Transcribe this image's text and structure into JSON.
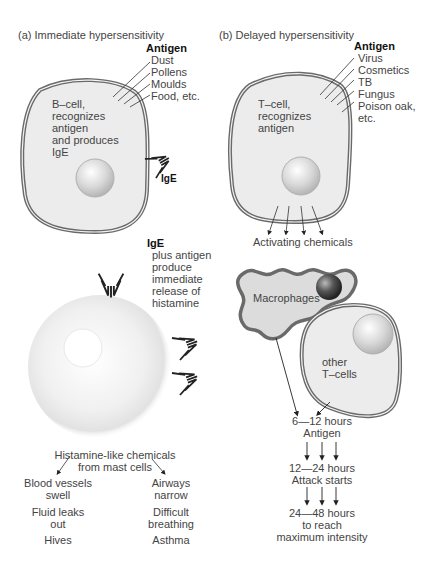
{
  "panel_a": {
    "title": "(a) Immediate hypersensitivity",
    "antigen_heading": "Antigen",
    "antigens": [
      "Dust",
      "Pollens",
      "Moulds",
      "Food, etc."
    ],
    "b_cell_label": [
      "B–cell,",
      "recognizes",
      "antigen",
      "and produces",
      "IgE"
    ],
    "ige_label": "IgE",
    "ige_heading": "IgE",
    "ige_description": [
      "plus antigen",
      "produce",
      "immediate",
      "release of",
      "histamine"
    ],
    "histamine_source": [
      "Histamine-like chemicals",
      "from mast cells"
    ],
    "left_effects": [
      [
        "Blood vessels",
        "swell"
      ],
      [
        "Fluid leaks",
        "out"
      ],
      [
        "Hives"
      ]
    ],
    "right_effects": [
      [
        "Airways",
        "narrow"
      ],
      [
        "Difficult",
        "breathing"
      ],
      [
        "Asthma"
      ]
    ]
  },
  "panel_b": {
    "title": "(b) Delayed hypersensitivity",
    "antigen_heading": "Antigen",
    "antigens": [
      "Virus",
      "Cosmetics",
      "TB",
      "Fungus",
      "Poison oak,",
      "etc."
    ],
    "t_cell_label": [
      "T–cell,",
      "recognizes",
      "antigen"
    ],
    "activating_label": "Activating chemicals",
    "macrophage_label": "Macrophages",
    "other_tcells_label": [
      "other",
      "T–cells"
    ],
    "timeline": [
      [
        "6—12 hours",
        "Antigen"
      ],
      [
        "12—24 hours",
        "Attack starts"
      ],
      [
        "24—48 hours",
        "to reach",
        "maximum intensity"
      ]
    ]
  },
  "colors": {
    "cell_fill": "#ececec",
    "membrane": "#6a6a6a",
    "nucleus": "#cfcfcf",
    "macrophage_fill": "#dcdcdc",
    "antibody": "#222222",
    "text": "#444444"
  }
}
